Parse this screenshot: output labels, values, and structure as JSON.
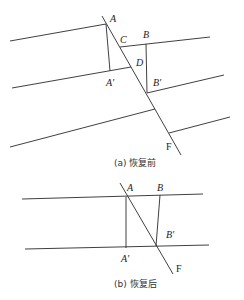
{
  "figure_a": {
    "caption": "(a) 恢复前",
    "labels": {
      "A": "A",
      "A_prime": "A'",
      "B": "B",
      "B_prime": "B'",
      "C": "C",
      "D": "D",
      "F": "F"
    }
  },
  "figure_b": {
    "caption": "(b) 恢复后",
    "labels": {
      "A": "A",
      "A_prime": "A'",
      "B": "B",
      "B_prime": "B'",
      "F": "F"
    }
  }
}
